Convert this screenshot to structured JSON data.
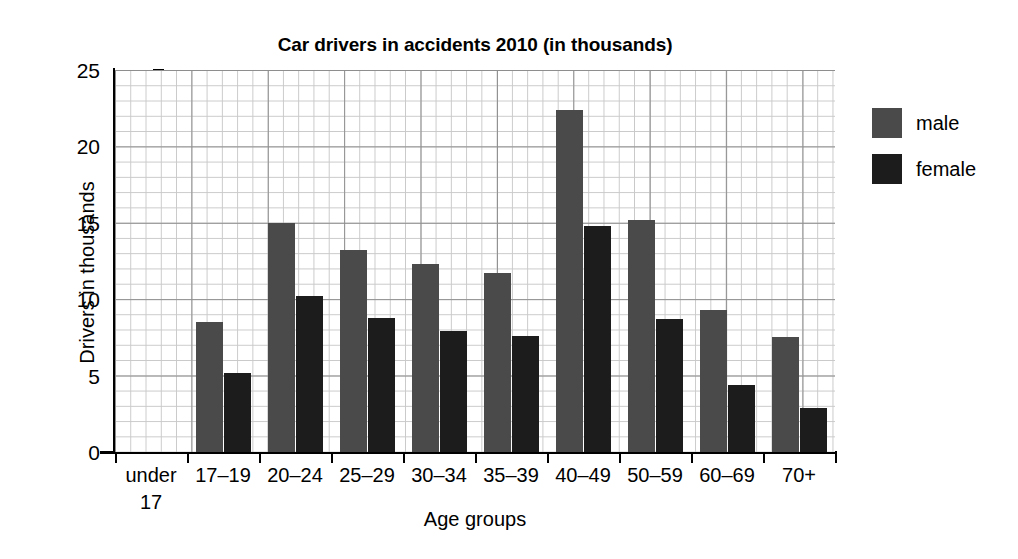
{
  "chart_data": {
    "type": "bar",
    "title": "Car drivers in accidents 2010 (in thousands)",
    "xlabel": "Age groups",
    "ylabel": "Drivers in thousands",
    "categories": [
      "under\n17",
      "17–19",
      "20–24",
      "25–29",
      "30–34",
      "35–39",
      "40–49",
      "50–59",
      "60–69",
      "70+"
    ],
    "series": [
      {
        "name": "male",
        "color": "#4a4a4a",
        "values": [
          0,
          8.5,
          15.0,
          13.2,
          12.3,
          11.7,
          22.4,
          15.2,
          9.3,
          7.5
        ]
      },
      {
        "name": "female",
        "color": "#1c1c1c",
        "values": [
          0,
          5.2,
          10.2,
          8.8,
          7.9,
          7.6,
          14.8,
          8.7,
          4.4,
          2.9
        ]
      }
    ],
    "ylim": [
      0,
      25
    ],
    "yticks": [
      0,
      5,
      10,
      15,
      20,
      25
    ],
    "yticklabels": [
      "0",
      "5",
      "10",
      "15",
      "20",
      "25"
    ],
    "grid": true,
    "grid_minor_step": 1,
    "grid_major_step": 5,
    "legend_position": "right",
    "legend_entries": [
      "male",
      "female"
    ]
  }
}
